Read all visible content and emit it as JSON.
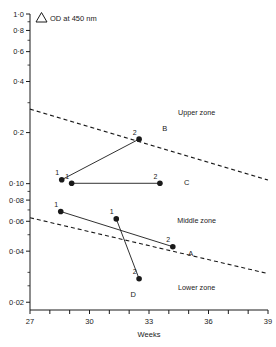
{
  "chart_data": {
    "type": "scatter",
    "title_symbol": "Δ",
    "title_text": "OD at  450 nm",
    "xlabel": "Weeks",
    "ylabel": "",
    "yscale": "log",
    "xlim": [
      27,
      39
    ],
    "ylim": [
      0.018,
      1.0
    ],
    "grid": false,
    "x_ticks": [
      27,
      28,
      29,
      30,
      31,
      32,
      33,
      34,
      35,
      36,
      37,
      38,
      39
    ],
    "x_tick_labels": [
      "27",
      "",
      "",
      "30",
      "",
      "",
      "33",
      "",
      "",
      "36",
      "",
      "",
      "39"
    ],
    "y_ticks": [
      1.0,
      0.8,
      0.6,
      0.4,
      0.2,
      0.1,
      0.08,
      0.06,
      0.04,
      0.02
    ],
    "y_tick_labels": [
      "1·0",
      "0·8",
      "0·6",
      "0·4",
      "0·2",
      "0·10",
      "0·08",
      "0·06",
      "0·04",
      "0·02"
    ],
    "zones": [
      {
        "name": "Upper zone",
        "label": "Upper zone"
      },
      {
        "name": "Middle zone",
        "label": "Middle zone"
      },
      {
        "name": "Lower zone",
        "label": "Lower zone"
      }
    ],
    "boundaries": [
      {
        "name": "upper-boundary",
        "style": "dashed",
        "x": [
          27,
          39
        ],
        "y": [
          0.275,
          0.105
        ]
      },
      {
        "name": "lower-boundary",
        "style": "dashed",
        "x": [
          27,
          39
        ],
        "y": [
          0.063,
          0.0295
        ]
      }
    ],
    "series": [
      {
        "name": "A",
        "label": "A",
        "label_x": 35.1,
        "label_y": 0.0375,
        "points": [
          {
            "label": "1",
            "x": 28.55,
            "y": 0.0685
          },
          {
            "label": "2",
            "x": 34.2,
            "y": 0.0425
          }
        ]
      },
      {
        "name": "B",
        "label": "B",
        "label_x": 33.8,
        "label_y": 0.205,
        "points": [
          {
            "label": "1",
            "x": 28.6,
            "y": 0.1055
          },
          {
            "label": "2",
            "x": 32.5,
            "y": 0.183
          }
        ]
      },
      {
        "name": "C",
        "label": "C",
        "label_x": 34.9,
        "label_y": 0.0985,
        "points": [
          {
            "label": "1",
            "x": 29.1,
            "y": 0.1005
          },
          {
            "label": "2",
            "x": 33.55,
            "y": 0.1005
          }
        ]
      },
      {
        "name": "D",
        "label": "D",
        "label_x": 32.2,
        "label_y": 0.0215,
        "points": [
          {
            "label": "1",
            "x": 31.35,
            "y": 0.062
          },
          {
            "label": "2",
            "x": 32.5,
            "y": 0.0275
          }
        ]
      }
    ],
    "zone_label_positions": [
      {
        "label": "Upper zone",
        "x": 35.4,
        "y": 0.255
      },
      {
        "label": "Middle zone",
        "x": 35.4,
        "y": 0.0585
      },
      {
        "label": "Lower zone",
        "x": 35.4,
        "y": 0.0235
      }
    ]
  }
}
